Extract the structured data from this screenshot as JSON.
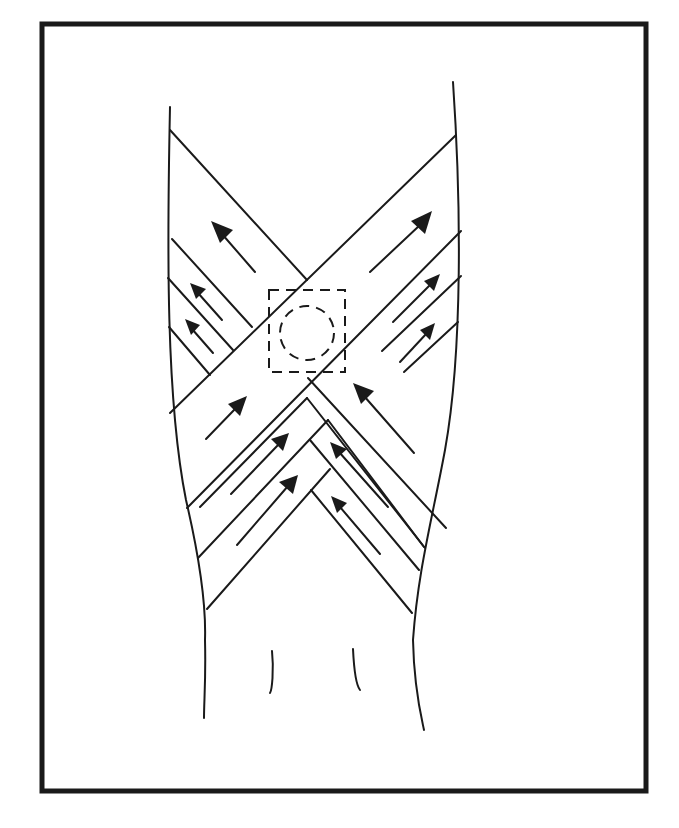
{
  "figure": {
    "colors": {
      "ink": "#1a1a1a",
      "background": "#ffffff"
    },
    "frame": {
      "x": 42,
      "y": 24,
      "width": 604,
      "height": 767
    },
    "limb_outline": {
      "left": "M170,107 C167,250 166,400 186,500 C200,560 206,610 205,640 C206,680 204,700 204,718",
      "right": "M453,82 C461,200 463,350 445,450 C432,520 418,570 413,640 C414,690 422,720 424,730"
    },
    "wrist_creases": [
      "M272,651 C274,670 272,690 270,693",
      "M353,649 C354,670 356,685 360,690"
    ],
    "strips": [
      {
        "name": "large-strip-up-left",
        "lines": [
          "M170,130 L305,282",
          "M355,373 L412,420"
        ]
      },
      {
        "name": "large-strip-up-right",
        "lines": [
          "M456,135 L170,413",
          "M461,232 L186,508"
        ]
      },
      {
        "name": "left-strip-1",
        "lines": [
          "M172,240 L252,328"
        ]
      },
      {
        "name": "left-strip-2",
        "lines": [
          "M168,278 L233,350"
        ]
      },
      {
        "name": "left-strip-3",
        "lines": [
          "M170,328 L210,375"
        ]
      },
      {
        "name": "right-strip-1",
        "lines": [
          "M461,275 L383,350"
        ]
      },
      {
        "name": "right-strip-2",
        "lines": [
          "M458,322 L404,371"
        ]
      },
      {
        "name": "lower-left-chevron-1",
        "lines": [
          "M326,391 L200,560"
        ]
      },
      {
        "name": "lower-left-chevron-2",
        "lines": [
          "M336,420 L206,612"
        ]
      },
      {
        "name": "lower-left-chevron-3",
        "lines": [
          "M305,398 L431,551"
        ]
      },
      {
        "name": "lower-right-chevron-1",
        "lines": [
          "M327,448 L424,581"
        ]
      },
      {
        "name": "lower-right-chevron-2",
        "lines": [
          "M310,490 L413,610"
        ]
      },
      {
        "name": "lower-left-v-2",
        "lines": [
          "M330,470 L198,588",
          "M310,490 L205,605"
        ]
      }
    ],
    "arrows": [
      {
        "name": "arrow-upper-left-large",
        "from": [
          255,
          272
        ],
        "to": [
          212,
          222
        ],
        "size": 14
      },
      {
        "name": "arrow-upper-right-large",
        "from": [
          370,
          272
        ],
        "to": [
          432,
          212
        ],
        "size": 14
      },
      {
        "name": "arrow-left-1",
        "from": [
          222,
          320
        ],
        "to": [
          190,
          284
        ],
        "size": 11
      },
      {
        "name": "arrow-left-2",
        "from": [
          213,
          353
        ],
        "to": [
          185,
          320
        ],
        "size": 11
      },
      {
        "name": "arrow-right-1",
        "from": [
          393,
          322
        ],
        "to": [
          440,
          274
        ],
        "size": 11
      },
      {
        "name": "arrow-right-2",
        "from": [
          400,
          362
        ],
        "to": [
          435,
          324
        ],
        "size": 11
      },
      {
        "name": "arrow-center-left",
        "from": [
          206,
          439
        ],
        "to": [
          246,
          397
        ],
        "size": 12
      },
      {
        "name": "arrow-center-right",
        "from": [
          414,
          453
        ],
        "to": [
          354,
          384
        ],
        "size": 12
      },
      {
        "name": "arrow-lower-left-1",
        "from": [
          231,
          494
        ],
        "to": [
          288,
          434
        ],
        "size": 11
      },
      {
        "name": "arrow-lower-left-2",
        "from": [
          237,
          545
        ],
        "to": [
          298,
          475
        ],
        "size": 12
      },
      {
        "name": "arrow-lower-right-1",
        "from": [
          388,
          507
        ],
        "to": [
          330,
          442
        ],
        "size": 11
      },
      {
        "name": "arrow-lower-right-2",
        "from": [
          380,
          554
        ],
        "to": [
          332,
          497
        ],
        "size": 11
      }
    ],
    "focus_marker": {
      "label": "site of injury (dashed)",
      "square": {
        "x": 269,
        "y": 290,
        "width": 76,
        "height": 82
      },
      "circle": {
        "cx": 307,
        "cy": 333,
        "r": 27
      }
    },
    "caption_fragment": ""
  }
}
